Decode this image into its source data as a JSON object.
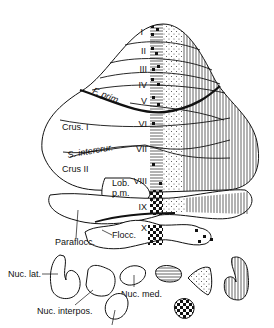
{
  "diagram": {
    "lobule_labels": [
      "I",
      "II",
      "III",
      "IV",
      "V",
      "VI",
      "VII",
      "VIII",
      "IX",
      "X"
    ],
    "region_labels": {
      "fissura_prima": "F. prim.",
      "crus_1": "Crus. I",
      "sulcus_intercrural": "S. intercrur.",
      "crus_2": "Crus II",
      "lobulus_paramedianus": [
        "Lob.",
        "p.m."
      ],
      "paraflocculus": "Paraflocc.",
      "flocculus": "Flocc."
    },
    "nuclei_labels": {
      "lateral": "Nuc. lat.",
      "interpositus": "Nuc. interpos.",
      "medial": "Nuc. med."
    },
    "zone_patterns": [
      "checkered",
      "horizontal-lines",
      "dotted",
      "vertical-lines"
    ],
    "colors": {
      "ink": "#111111",
      "background": "#ffffff"
    }
  }
}
